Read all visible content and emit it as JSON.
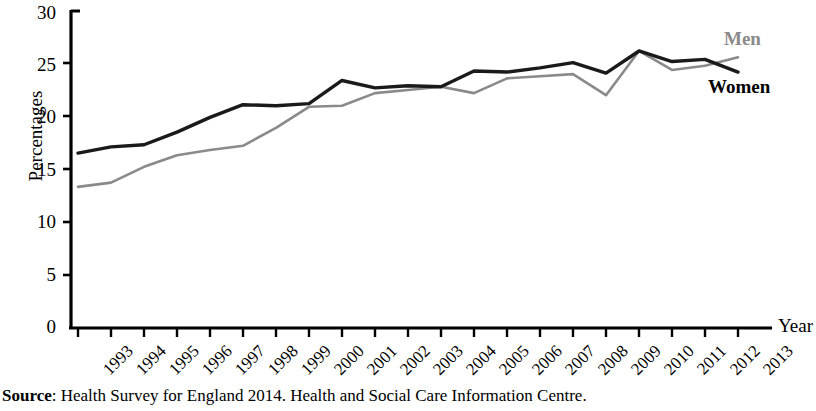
{
  "chart_data": {
    "type": "line",
    "title": "",
    "xlabel": "Year",
    "ylabel": "Percentages",
    "ylim": [
      0,
      30
    ],
    "yticks": [
      0,
      5,
      10,
      15,
      20,
      25,
      30
    ],
    "grid": false,
    "legend_position": "right-inline",
    "categories": [
      "1993",
      "1994",
      "1995",
      "1996",
      "1997",
      "1998",
      "1999",
      "2000",
      "2001",
      "2002",
      "2003",
      "2004",
      "2005",
      "2006",
      "2007",
      "2008",
      "2009",
      "2010",
      "2011",
      "2012",
      "2013"
    ],
    "series": [
      {
        "name": "Men",
        "color": "#8a8a8a",
        "values": [
          13.4,
          13.8,
          15.3,
          16.4,
          16.9,
          17.3,
          19.0,
          21.0,
          21.1,
          22.3,
          22.6,
          22.9,
          22.3,
          23.7,
          23.9,
          24.1,
          22.1,
          26.3,
          24.5,
          24.9,
          25.7
        ]
      },
      {
        "name": "Women",
        "color": "#1a1a1a",
        "values": [
          16.6,
          17.2,
          17.4,
          18.6,
          20.0,
          21.2,
          21.1,
          21.3,
          23.5,
          22.8,
          23.0,
          22.9,
          24.4,
          24.3,
          24.7,
          25.2,
          24.2,
          26.3,
          25.3,
          25.5,
          24.3
        ]
      }
    ]
  },
  "labels": {
    "men": "Men",
    "women": "Women",
    "y_axis_title": "Percentages",
    "x_axis_title": "Year"
  },
  "source": {
    "prefix": "Source",
    "text": ": Health Survey for England 2014.  Health and Social Care Information Centre."
  },
  "colors": {
    "men_line": "#8a8a8a",
    "women_line": "#1a1a1a",
    "axis": "#000000",
    "background": "#ffffff"
  }
}
